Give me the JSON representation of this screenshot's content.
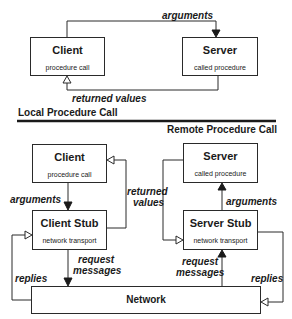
{
  "local": {
    "section_label": "Local Procedure Call",
    "client": {
      "title": "Client",
      "subtitle": "procedure call"
    },
    "server": {
      "title": "Server",
      "subtitle": "called procedure"
    },
    "arrows": {
      "arguments": "arguments",
      "returned_values": "returned values"
    }
  },
  "remote": {
    "section_label": "Remote Procedure Call",
    "client": {
      "title": "Client",
      "subtitle": "procedure call"
    },
    "client_stub": {
      "title": "Client Stub",
      "subtitle": "network transport"
    },
    "server": {
      "title": "Server",
      "subtitle": "called procedure"
    },
    "server_stub": {
      "title": "Server Stub",
      "subtitle": "network transport"
    },
    "network": {
      "title": "Network"
    },
    "arrows": {
      "client_arguments": "arguments",
      "server_arguments": "arguments",
      "returned_values_line1": "returned",
      "returned_values_line2": "values",
      "client_request_line1": "request",
      "client_request_line2": "messages",
      "server_request_line1": "request",
      "server_request_line2": "messages",
      "replies_left": "replies",
      "replies_right": "replies"
    }
  },
  "colors": {
    "line": "#2a2a2a",
    "background": "#ffffff"
  }
}
